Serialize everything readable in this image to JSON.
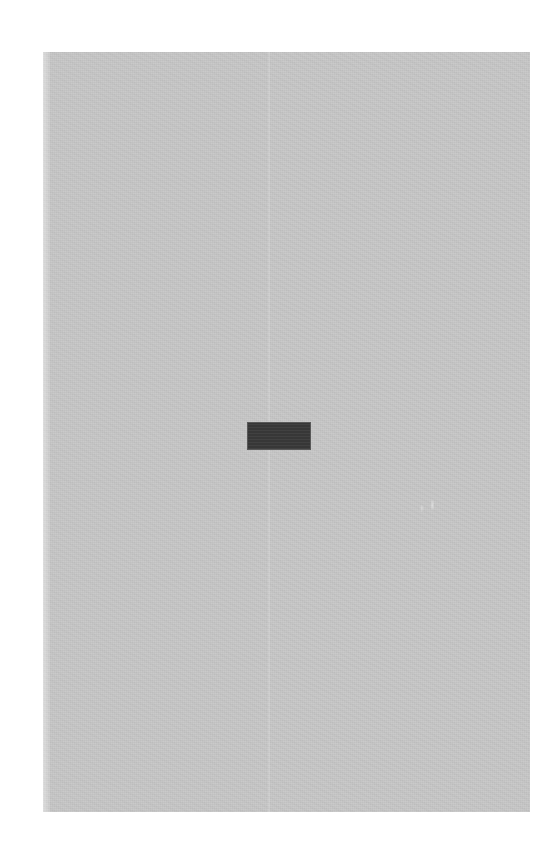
{
  "canvas": {
    "width": 542,
    "height": 862,
    "background_color": "#ffffff"
  },
  "panel": {
    "name": "content-panel",
    "background_color": "#c6c6c6",
    "left": 43,
    "top": 52,
    "width": 487,
    "height": 760,
    "text": "",
    "has_visible_text": false
  },
  "block": {
    "name": "dark-block",
    "fill_color": "#3a3a3a",
    "border_color": "#9a9a9a",
    "left": 247,
    "top": 422,
    "width": 64,
    "height": 28,
    "label": "",
    "has_visible_text": false
  },
  "artifacts": {
    "seam": {
      "name": "vertical-seam",
      "x": 268,
      "description": ""
    },
    "blemish": {
      "name": "light-speck",
      "x": 417,
      "y": 496,
      "description": ""
    }
  },
  "state": {
    "visible_text_count": 0,
    "status": ""
  }
}
